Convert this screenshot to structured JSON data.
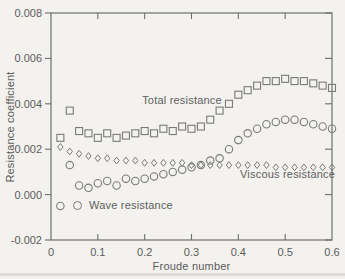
{
  "figure": {
    "background": "#f3f2ee",
    "axis_color": "#6e6e6e",
    "marker_color": "#7a7a7a",
    "text_color": "#5c5c5c"
  },
  "chart_data": {
    "type": "scatter",
    "title": "",
    "xlabel": "Froude number",
    "ylabel": "Resistance coefficient",
    "xlim": [
      0,
      0.6
    ],
    "ylim": [
      -0.002,
      0.008
    ],
    "grid": false,
    "x_tick_values": [
      0,
      0.1,
      0.2,
      0.3,
      0.4,
      0.5,
      0.6
    ],
    "x_tick_labels": [
      "0",
      "0.1",
      "0.2",
      "0.3",
      "0.4",
      "0.5",
      "0.6"
    ],
    "y_tick_values": [
      0.008,
      0.006,
      0.004,
      0.002,
      0.0,
      -0.002
    ],
    "y_tick_labels": [
      "0.008",
      "0.006",
      "0.004",
      "0.002",
      "0.000",
      "-0.002"
    ],
    "x": [
      0.02,
      0.04,
      0.06,
      0.08,
      0.1,
      0.12,
      0.14,
      0.16,
      0.18,
      0.2,
      0.22,
      0.24,
      0.26,
      0.28,
      0.3,
      0.32,
      0.34,
      0.36,
      0.38,
      0.4,
      0.42,
      0.44,
      0.46,
      0.48,
      0.5,
      0.52,
      0.54,
      0.56,
      0.58,
      0.6
    ],
    "series": [
      {
        "name": "Total resistance",
        "marker": "square",
        "values": [
          0.0025,
          0.0037,
          0.0028,
          0.0027,
          0.0025,
          0.0027,
          0.0025,
          0.0026,
          0.0027,
          0.0028,
          0.0027,
          0.0029,
          0.0028,
          0.003,
          0.0029,
          0.003,
          0.0033,
          0.0037,
          0.004,
          0.0044,
          0.0046,
          0.0048,
          0.005,
          0.005,
          0.0051,
          0.005,
          0.005,
          0.0049,
          0.0048,
          0.0047
        ]
      },
      {
        "name": "Wave resistance",
        "marker": "circle",
        "values": [
          -0.0005,
          0.0013,
          0.0004,
          0.0003,
          0.0005,
          0.0006,
          0.0004,
          0.0007,
          0.0006,
          0.0007,
          0.0008,
          0.0009,
          0.001,
          0.0011,
          0.0012,
          0.0013,
          0.0015,
          0.0016,
          0.002,
          0.0024,
          0.0027,
          0.0029,
          0.0031,
          0.0032,
          0.0033,
          0.0033,
          0.0032,
          0.0031,
          0.003,
          0.0029
        ]
      },
      {
        "name": "Viscous resistance",
        "marker": "diamond",
        "values": [
          0.0021,
          0.0019,
          0.0018,
          0.0017,
          0.0016,
          0.0016,
          0.0015,
          0.0015,
          0.0015,
          0.0014,
          0.0014,
          0.0014,
          0.0014,
          0.0014,
          0.0013,
          0.0013,
          0.0013,
          0.0013,
          0.0013,
          0.0013,
          0.0013,
          0.0013,
          0.0013,
          0.0012,
          0.0012,
          0.0012,
          0.0012,
          0.0012,
          0.0012,
          0.0012
        ]
      }
    ],
    "legend_position": "in-plot text annotations"
  }
}
